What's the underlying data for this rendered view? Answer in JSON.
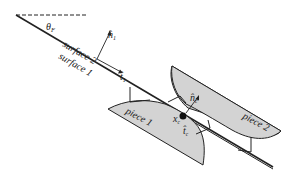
{
  "labels": {
    "angle": "θ",
    "angle_sub": "F",
    "surface2": "surface 2",
    "surface1": "surface 1",
    "normal_hat": "n̂",
    "normal_sub": "1",
    "tangent_hat": "t̂",
    "tangent_sub": "1",
    "piece1": "piece 1",
    "piece2": "piece 2",
    "contact_normal": "n̂",
    "contact_normal_sub": "c",
    "contact_tangent": "t̂",
    "contact_tangent_sub": "c",
    "contact_point": "x",
    "contact_point_sub": "c"
  },
  "colors": {
    "piece_fill": "#d3d3d3",
    "stroke": "#222222"
  }
}
